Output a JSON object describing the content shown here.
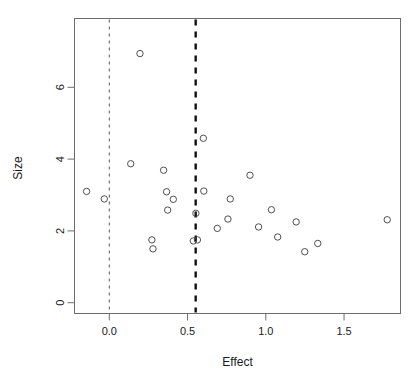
{
  "chart_data": {
    "type": "scatter",
    "title": "",
    "xlabel": "Effect",
    "ylabel": "Size",
    "xlim": [
      -0.22,
      1.86
    ],
    "ylim": [
      -0.25,
      7.5
    ],
    "grid": false,
    "legend": null,
    "xticks": [
      0.0,
      0.5,
      1.0,
      1.5
    ],
    "xtick_labels": [
      "0.0",
      "0.5",
      "1.0",
      "1.5"
    ],
    "yticks": [
      0,
      2,
      4,
      6
    ],
    "ytick_labels": [
      "0",
      "2",
      "4",
      "6"
    ],
    "marker": {
      "shape": "circle-open",
      "radius_px": 3.2,
      "stroke": "#3c3c3c",
      "stroke_width": 0.9,
      "fill": "none"
    },
    "points": [
      {
        "x": -0.145,
        "y": 3.1
      },
      {
        "x": -0.032,
        "y": 2.89
      },
      {
        "x": 0.137,
        "y": 3.87
      },
      {
        "x": 0.196,
        "y": 6.94
      },
      {
        "x": 0.272,
        "y": 1.75
      },
      {
        "x": 0.279,
        "y": 1.5
      },
      {
        "x": 0.347,
        "y": 3.69
      },
      {
        "x": 0.366,
        "y": 3.09
      },
      {
        "x": 0.409,
        "y": 2.88
      },
      {
        "x": 0.373,
        "y": 2.58
      },
      {
        "x": 0.537,
        "y": 1.72
      },
      {
        "x": 0.563,
        "y": 1.75
      },
      {
        "x": 0.553,
        "y": 2.49
      },
      {
        "x": 0.601,
        "y": 4.58
      },
      {
        "x": 0.604,
        "y": 3.11
      },
      {
        "x": 0.69,
        "y": 2.07
      },
      {
        "x": 0.758,
        "y": 2.33
      },
      {
        "x": 0.773,
        "y": 2.89
      },
      {
        "x": 0.899,
        "y": 3.55
      },
      {
        "x": 0.954,
        "y": 2.11
      },
      {
        "x": 1.036,
        "y": 2.59
      },
      {
        "x": 1.076,
        "y": 1.83
      },
      {
        "x": 1.194,
        "y": 2.25
      },
      {
        "x": 1.249,
        "y": 1.42
      },
      {
        "x": 1.332,
        "y": 1.65
      },
      {
        "x": 1.776,
        "y": 2.31
      }
    ],
    "reference_lines": [
      {
        "name": "null-effect-line",
        "orientation": "vertical",
        "x": 0.0,
        "style": "dashed-thin",
        "color": "#2b2b2b",
        "width": 0.8
      },
      {
        "name": "pooled-effect-line",
        "orientation": "vertical",
        "x": 0.552,
        "style": "dashed-thick",
        "color": "#111111",
        "width": 2.4
      }
    ]
  },
  "axes": {
    "x_title": "Effect",
    "y_title": "Size",
    "box_color": "#6e6e6e"
  }
}
